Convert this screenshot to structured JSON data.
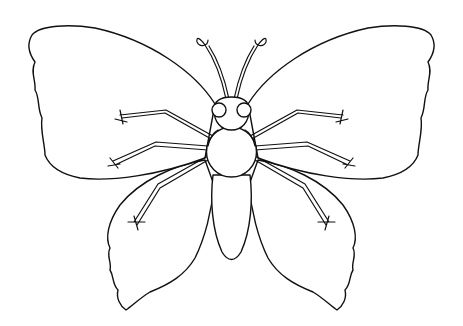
{
  "image": {
    "subject": "butterfly line-art coloring page",
    "background_color": "#ffffff",
    "line_color": "#111111"
  },
  "parts": {
    "upper_left_wing": "upper-left-wing",
    "upper_right_wing": "upper-right-wing",
    "lower_left_wing": "lower-left-wing",
    "lower_right_wing": "lower-right-wing",
    "head": "head",
    "thorax": "thorax",
    "abdomen": "abdomen",
    "antennae": "antennae",
    "legs_count": 6
  }
}
